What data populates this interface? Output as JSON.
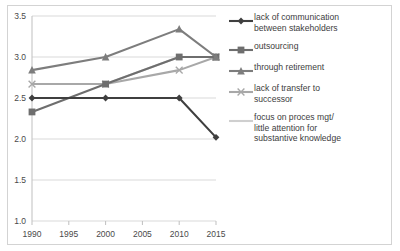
{
  "chart_data": {
    "type": "line",
    "title": "",
    "xlabel": "",
    "ylabel": "",
    "x": [
      1990,
      1995,
      2000,
      2005,
      2010,
      2015
    ],
    "categories": [
      "1990",
      "1995",
      "2000",
      "2005",
      "2010",
      "2015"
    ],
    "xtick_labels": [
      "1990",
      "1995",
      "2000",
      "2005",
      "2010",
      "2015"
    ],
    "ytick_labels": [
      "1.0",
      "1.5",
      "2.0",
      "2.5",
      "3.0",
      "3.5"
    ],
    "ytick_values": [
      1.0,
      1.5,
      2.0,
      2.5,
      3.0,
      3.5
    ],
    "xlim": [
      1990,
      2015
    ],
    "ylim": [
      1.0,
      3.5
    ],
    "grid": "horizontal",
    "legend_position": "right",
    "series": [
      {
        "name": "lack of communication between stakeholders",
        "marker": "diamond",
        "color": "#3f3f3f",
        "x": [
          1990,
          2000,
          2010,
          2015
        ],
        "values": [
          2.5,
          2.5,
          2.5,
          2.02
        ]
      },
      {
        "name": "outsourcing",
        "marker": "square",
        "color": "#6e6e6e",
        "x": [
          1990,
          2000,
          2010,
          2015
        ],
        "values": [
          2.33,
          2.67,
          3.0,
          3.0
        ]
      },
      {
        "name": "through retirement",
        "marker": "triangle",
        "color": "#7d7d7d",
        "x": [
          1990,
          2000,
          2010,
          2015
        ],
        "values": [
          2.84,
          3.0,
          3.34,
          3.0
        ]
      },
      {
        "name": "lack of transfer to successor",
        "marker": "cross",
        "color": "#a8a8a8",
        "x": [
          1990,
          2000,
          2010,
          2015
        ],
        "values": [
          2.67,
          2.67,
          2.84,
          3.0
        ]
      },
      {
        "name": "focus on proces mgt/ little attention for substantive knowledge",
        "marker": "none",
        "color": "#cfcfcf",
        "x": [
          1990,
          2000,
          2010,
          2015
        ],
        "values": [
          2.67,
          2.67,
          3.0,
          3.0
        ]
      }
    ]
  },
  "legend": {
    "items": [
      {
        "label": "lack of communication\nbetween stakeholders",
        "marker": "diamond",
        "color": "#3f3f3f"
      },
      {
        "label": "outsourcing",
        "marker": "square",
        "color": "#6e6e6e"
      },
      {
        "label": "through retirement",
        "marker": "triangle",
        "color": "#7d7d7d"
      },
      {
        "label": "lack of transfer to\nsuccessor",
        "marker": "cross",
        "color": "#a8a8a8"
      },
      {
        "label": "focus on proces mgt/\nlittle attention for\nsubstantive knowledge",
        "marker": "none",
        "color": "#cfcfcf"
      }
    ]
  },
  "axes": {
    "y_labels": [
      "3.5",
      "3.0",
      "2.5",
      "2.0",
      "1.5",
      "1.0"
    ],
    "x_labels": [
      "1990",
      "1995",
      "2000",
      "2005",
      "2010",
      "2015"
    ]
  },
  "colors": {
    "grid": "#d9d9d9",
    "axis": "#bfbfbf",
    "border": "#d3d3d3",
    "text": "#4a4a4a",
    "background": "#ffffff"
  }
}
